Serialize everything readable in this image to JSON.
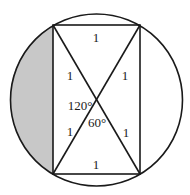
{
  "diagram": {
    "type": "geometry",
    "colors": {
      "stroke": "#1a1a1a",
      "shade": "#c8c8c8",
      "background": "#ffffff"
    },
    "circle": {
      "cx": 96.5,
      "cy": 100,
      "r": 86
    },
    "rectangle": {
      "corners": {
        "top_left": [
          53,
          25
        ],
        "top_right": [
          140,
          25
        ],
        "bottom_right": [
          140,
          174
        ],
        "bottom_left": [
          53,
          174
        ]
      }
    },
    "diagonal_intersection": [
      96.5,
      99.5
    ],
    "labels": {
      "top_side": "1",
      "bottom_side": "1",
      "upper_left_half_diagonal": "1",
      "upper_right_half_diagonal": "1",
      "lower_left_half_diagonal": "1",
      "lower_right_half_diagonal": "1",
      "obtuse_angle": "120°",
      "acute_angle": "60°"
    },
    "shaded_region": "left circular segment"
  }
}
